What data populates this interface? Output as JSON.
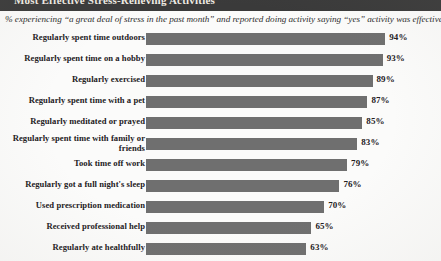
{
  "header": {
    "strip_title": "Most Effective Stress-Relieving Activities",
    "strip_color": "#3a3a3a"
  },
  "subtitle": "% experiencing “a great deal of stress in the past month” and reported doing activity saying “yes” activity was effective…",
  "colors": {
    "bar": "#6f6f6f",
    "text": "#23201d",
    "background": "#fbfbfa"
  },
  "chart_data": {
    "type": "bar",
    "orientation": "horizontal",
    "title": "Most Effective Stress-Relieving Activities",
    "subtitle": "% experiencing “a great deal of stress in the past month” and reported doing activity saying “yes” activity was effective…",
    "xlabel": "",
    "ylabel": "",
    "xlim": [
      0,
      100
    ],
    "grid": false,
    "legend": false,
    "value_suffix": "%",
    "categories": [
      "Regularly spent time outdoors",
      "Regularly spent time on a hobby",
      "Regularly exercised",
      "Regularly spent time with a pet",
      "Regularly meditated or prayed",
      "Regularly spent time with family or friends",
      "Took time off work",
      "Regularly got a full night's sleep",
      "Used prescription medication",
      "Received professional help",
      "Regularly ate healthfully"
    ],
    "values": [
      94,
      93,
      89,
      87,
      85,
      83,
      79,
      76,
      70,
      65,
      63
    ],
    "value_labels": [
      "94%",
      "93%",
      "89%",
      "87%",
      "85%",
      "83%",
      "79%",
      "76%",
      "70%",
      "65%",
      "63%"
    ]
  }
}
